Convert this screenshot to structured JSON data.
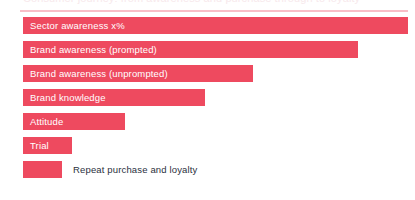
{
  "heading": {
    "text_sliver": "Consumer journey: from awareness and purchase through to loyalty",
    "rule_color": "#f6a8b4"
  },
  "colors": {
    "bar": "#ee4a5f",
    "inside_label_text": "#ffffff",
    "outside_label_text": "#2b3040",
    "background": "#ffffff"
  },
  "chart_data": {
    "type": "bar",
    "orientation": "horizontal",
    "title": "",
    "subtitle": "",
    "xlabel": "",
    "ylabel": "",
    "grid": false,
    "legend": "none",
    "xlim": [
      0,
      415
    ],
    "categories": [
      "Sector awareness x%",
      "Brand awareness (prompted)",
      "Brand awareness (unprompted)",
      "Brand knowledge",
      "Attitude",
      "Trial",
      "Repeat purchase and loyalty"
    ],
    "values": [
      385,
      335,
      230,
      182,
      102,
      49,
      39
    ],
    "value_unit": "px",
    "bars": [
      {
        "label": "Sector awareness x%",
        "width": 385,
        "label_position": "inside"
      },
      {
        "label": "Brand awareness (prompted)",
        "width": 335,
        "label_position": "inside"
      },
      {
        "label": "Brand awareness (unprompted)",
        "width": 230,
        "label_position": "inside"
      },
      {
        "label": "Brand knowledge",
        "width": 182,
        "label_position": "inside"
      },
      {
        "label": "Attitude",
        "width": 102,
        "label_position": "inside"
      },
      {
        "label": "Trial",
        "width": 49,
        "label_position": "inside"
      },
      {
        "label": "Repeat purchase and loyalty",
        "width": 39,
        "label_position": "outside"
      }
    ]
  }
}
